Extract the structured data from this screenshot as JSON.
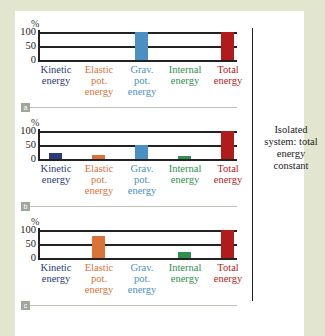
{
  "labels": {
    "percent": "%",
    "ticks": [
      "100",
      "50",
      "0"
    ],
    "categories": [
      {
        "line1": "Kinetic",
        "line2": "energy",
        "line3": "",
        "color": "#2b3a7a"
      },
      {
        "line1": "Elastic",
        "line2": "pot.",
        "line3": "energy",
        "color": "#d9733a"
      },
      {
        "line1": "Grav.",
        "line2": "pot.",
        "line3": "energy",
        "color": "#4a90c2"
      },
      {
        "line1": "Internal",
        "line2": "energy",
        "line3": "",
        "color": "#2f8f4e"
      },
      {
        "line1": "Total",
        "line2": "energy",
        "line3": "",
        "color": "#b01c1c"
      }
    ],
    "panel_tags": [
      "a",
      "b",
      "c"
    ],
    "note": "Isolated system: total energy constant"
  },
  "chart_data": [
    {
      "type": "bar",
      "title": "a",
      "categories": [
        "Kinetic energy",
        "Elastic pot. energy",
        "Grav. pot. energy",
        "Internal energy",
        "Total energy"
      ],
      "values": [
        0,
        0,
        100,
        0,
        100
      ],
      "ylabel": "%",
      "ylim": [
        0,
        100
      ]
    },
    {
      "type": "bar",
      "title": "b",
      "categories": [
        "Kinetic energy",
        "Elastic pot. energy",
        "Grav. pot. energy",
        "Internal energy",
        "Total energy"
      ],
      "values": [
        20,
        15,
        50,
        10,
        100
      ],
      "ylabel": "%",
      "ylim": [
        0,
        100
      ]
    },
    {
      "type": "bar",
      "title": "c",
      "categories": [
        "Kinetic energy",
        "Elastic pot. energy",
        "Grav. pot. energy",
        "Internal energy",
        "Total energy"
      ],
      "values": [
        0,
        80,
        0,
        20,
        100
      ],
      "ylabel": "%",
      "ylim": [
        0,
        100
      ]
    }
  ]
}
